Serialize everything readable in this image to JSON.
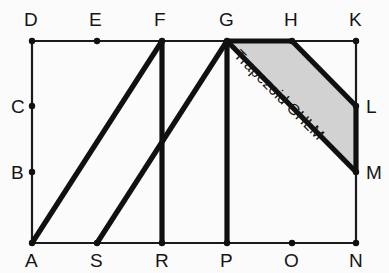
{
  "figure": {
    "background_color": "#fbfbfb",
    "line_color": "#101010",
    "shade_color": "#d2d2d2",
    "region_label": "Trapezoid GHLM",
    "region_label_rotation_deg": 45,
    "vertices": [
      {
        "name": "D",
        "x": 32,
        "y": 41,
        "label_x": 24,
        "label_y": 26,
        "dot": true
      },
      {
        "name": "E",
        "x": 97,
        "y": 41,
        "label_x": 89,
        "label_y": 26,
        "dot": true
      },
      {
        "name": "F",
        "x": 162,
        "y": 41,
        "label_x": 154,
        "label_y": 26,
        "dot": true
      },
      {
        "name": "G",
        "x": 227,
        "y": 41,
        "label_x": 219,
        "label_y": 26,
        "dot": true
      },
      {
        "name": "H",
        "x": 292,
        "y": 41,
        "label_x": 284,
        "label_y": 26,
        "dot": true
      },
      {
        "name": "K",
        "x": 356,
        "y": 41,
        "label_x": 349,
        "label_y": 26,
        "dot": true
      },
      {
        "name": "C",
        "x": 32,
        "y": 106,
        "label_x": 11,
        "label_y": 113,
        "dot": true
      },
      {
        "name": "B",
        "x": 32,
        "y": 172,
        "label_x": 11,
        "label_y": 179,
        "dot": true
      },
      {
        "name": "L",
        "x": 356,
        "y": 106,
        "label_x": 366,
        "label_y": 113,
        "dot": true
      },
      {
        "name": "M",
        "x": 356,
        "y": 172,
        "label_x": 366,
        "label_y": 179,
        "dot": true
      },
      {
        "name": "A",
        "x": 32,
        "y": 243,
        "label_x": 25,
        "label_y": 267,
        "dot": true
      },
      {
        "name": "S",
        "x": 97,
        "y": 243,
        "label_x": 90,
        "label_y": 267,
        "dot": true
      },
      {
        "name": "R",
        "x": 162,
        "y": 243,
        "label_x": 155,
        "label_y": 267,
        "dot": true
      },
      {
        "name": "P",
        "x": 227,
        "y": 243,
        "label_x": 220,
        "label_y": 267,
        "dot": true
      },
      {
        "name": "O",
        "x": 292,
        "y": 243,
        "label_x": 284,
        "label_y": 267,
        "dot": true
      },
      {
        "name": "N",
        "x": 356,
        "y": 243,
        "label_x": 349,
        "label_y": 267,
        "dot": true
      }
    ],
    "frame_segments": [
      {
        "name": "top-edge-DK",
        "x1": 32,
        "y1": 41,
        "x2": 356,
        "y2": 41
      },
      {
        "name": "bottom-edge-AN",
        "x1": 32,
        "y1": 243,
        "x2": 356,
        "y2": 243
      },
      {
        "name": "left-edge-DA",
        "x1": 32,
        "y1": 41,
        "x2": 32,
        "y2": 243
      },
      {
        "name": "right-edge-KN",
        "x1": 356,
        "y1": 41,
        "x2": 356,
        "y2": 243
      }
    ],
    "thick_segments": [
      {
        "name": "diagonal-AF",
        "x1": 32,
        "y1": 243,
        "x2": 162,
        "y2": 41
      },
      {
        "name": "diagonal-SG",
        "x1": 97,
        "y1": 243,
        "x2": 227,
        "y2": 41
      },
      {
        "name": "vertical-FR",
        "x1": 162,
        "y1": 41,
        "x2": 162,
        "y2": 243
      },
      {
        "name": "vertical-GP",
        "x1": 227,
        "y1": 41,
        "x2": 227,
        "y2": 243
      },
      {
        "name": "segment-GM",
        "x1": 227,
        "y1": 41,
        "x2": 356,
        "y2": 172
      },
      {
        "name": "segment-HL",
        "x1": 292,
        "y1": 41,
        "x2": 356,
        "y2": 106
      },
      {
        "name": "segment-GH",
        "x1": 227,
        "y1": 41,
        "x2": 292,
        "y2": 41
      },
      {
        "name": "segment-LM",
        "x1": 356,
        "y1": 106,
        "x2": 356,
        "y2": 172
      }
    ],
    "shaded_polygon": {
      "name": "trapezoid-GHLM",
      "points": "227,41 292,41 356,106 356,172"
    },
    "label_anchor": {
      "x": 233,
      "y": 56
    }
  }
}
